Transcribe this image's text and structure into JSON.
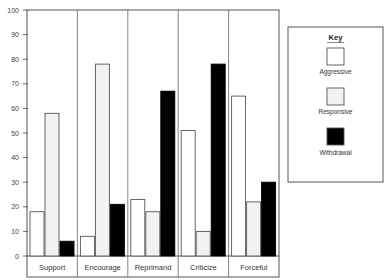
{
  "chart_data": {
    "type": "bar",
    "title": "",
    "xlabel": "",
    "ylabel": "",
    "ylim": [
      0,
      100
    ],
    "yticks": [
      0,
      10,
      20,
      30,
      40,
      50,
      60,
      70,
      80,
      90,
      100
    ],
    "grid": false,
    "legend_position": "right",
    "legend_title": "Key",
    "categories": [
      "Support",
      "Encourage",
      "Reprimand",
      "Criticize",
      "Forceful"
    ],
    "series": [
      {
        "name": "Aggressive",
        "color": "#ffffff",
        "values": [
          18,
          8,
          23,
          51,
          65
        ]
      },
      {
        "name": "Responsive",
        "color": "#f2f2f2",
        "values": [
          58,
          78,
          18,
          10,
          22
        ]
      },
      {
        "name": "Withdrawal",
        "color": "#000000",
        "values": [
          6,
          21,
          67,
          78,
          30
        ]
      }
    ]
  },
  "legend": {
    "title": "Key",
    "items": [
      {
        "label": "Aggressive"
      },
      {
        "label": "Responsive"
      },
      {
        "label": "Withdrawal"
      }
    ]
  }
}
